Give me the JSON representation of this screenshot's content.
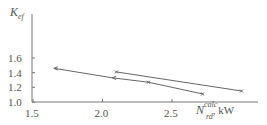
{
  "chart_data": {
    "type": "line",
    "title": "",
    "ylabel": "K_ef",
    "ylabel_main": "K",
    "ylabel_sub": "ef",
    "xlabel": "N_rd^calc, kW",
    "xlabel_main": "N",
    "xlabel_sub": "rd",
    "xlabel_sup": "calc",
    "xlabel_unit": ", kW",
    "xlim": [
      1.5,
      3.05
    ],
    "ylim": [
      1.0,
      1.75
    ],
    "x_ticks": [
      "1.5",
      "2.0",
      "2.5"
    ],
    "x_tick_values": [
      1.5,
      2.0,
      2.5
    ],
    "y_ticks": [
      "1.0",
      "1.2",
      "1.4",
      "1.6"
    ],
    "y_tick_values": [
      1.0,
      1.2,
      1.4,
      1.6
    ],
    "grid": false,
    "legend": null,
    "series": [
      {
        "name": "series-1",
        "x": [
          1.65,
          2.07,
          2.33,
          2.72
        ],
        "y": [
          1.46,
          1.33,
          1.27,
          1.11
        ],
        "markers": [
          "arrow",
          "arrow",
          "x",
          "x"
        ],
        "color": "#666666"
      },
      {
        "name": "series-2",
        "x": [
          2.1,
          3.0
        ],
        "y": [
          1.41,
          1.15
        ],
        "markers": [
          "x",
          "x"
        ],
        "color": "#666666"
      }
    ]
  }
}
